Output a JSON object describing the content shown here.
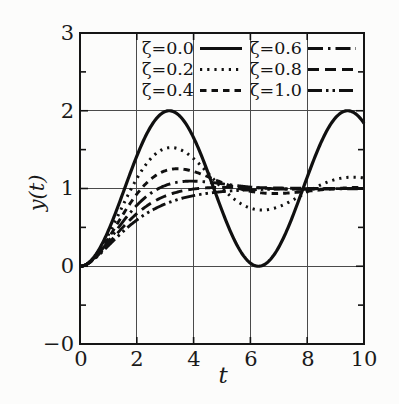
{
  "figure": {
    "background": "#fcfcfb",
    "ink": "#101010",
    "grid_color": "#4a4a4a"
  },
  "chart_data": {
    "type": "line",
    "title": "",
    "xlabel": "t",
    "ylabel": "y(t)",
    "xlim": [
      0,
      10
    ],
    "ylim": [
      -1,
      3
    ],
    "xtick_labels": [
      "0",
      "2",
      "4",
      "6",
      "8",
      "10"
    ],
    "xtick_values": [
      0,
      2,
      4,
      6,
      8,
      10
    ],
    "ytick_labels": [
      "3",
      "2",
      "1",
      "0",
      "−0"
    ],
    "ytick_values": [
      3,
      2,
      1,
      0,
      -1
    ],
    "grid": {
      "x": [
        2,
        4,
        6,
        8
      ],
      "y": [
        0,
        1,
        2
      ]
    },
    "minor_yticks": [
      -0.5,
      0.5,
      1.5,
      2.5
    ],
    "legend_position": "top-inside-two-columns",
    "model": "unit-step response of second-order system, omega_n = 1, parameter zeta",
    "x_samples": [
      0,
      1,
      2,
      3,
      4,
      5,
      6,
      7,
      8,
      9,
      10
    ],
    "series": [
      {
        "name": "ζ=0.0",
        "zeta": 0.0,
        "style": "solid",
        "dash": "",
        "width": 3.2,
        "values": [
          0,
          0.46,
          1.42,
          1.99,
          1.65,
          0.72,
          0.04,
          0.25,
          1.15,
          1.91,
          1.84
        ]
      },
      {
        "name": "ζ=0.2",
        "zeta": 0.2,
        "style": "dotted",
        "dash": "2.2 5",
        "width": 3.0,
        "values": [
          0,
          0.41,
          1.13,
          1.52,
          1.38,
          1.01,
          0.75,
          0.77,
          0.96,
          1.12,
          1.14
        ]
      },
      {
        "name": "ζ=0.4",
        "zeta": 0.4,
        "style": "short-dash",
        "dash": "6.5 5",
        "width": 2.9,
        "values": [
          0,
          0.36,
          0.93,
          1.23,
          1.22,
          1.08,
          0.96,
          0.94,
          0.96,
          1.0,
          1.02
        ]
      },
      {
        "name": "ζ=0.6",
        "zeta": 0.6,
        "style": "dash-dot",
        "dash": "15 5 2.5 5",
        "width": 2.9,
        "values": [
          0,
          0.32,
          0.78,
          1.04,
          1.09,
          1.06,
          1.02,
          0.99,
          0.99,
          1.0,
          1.0
        ]
      },
      {
        "name": "ζ=0.8",
        "zeta": 0.8,
        "style": "long-dash",
        "dash": "11 6",
        "width": 2.9,
        "values": [
          0,
          0.29,
          0.68,
          0.9,
          0.99,
          1.01,
          1.01,
          1.01,
          1.0,
          1.0,
          1.0
        ]
      },
      {
        "name": "ζ=1.0",
        "zeta": 1.0,
        "style": "dash-dot-dot",
        "dash": "14 4 2.5 4 2.5 4",
        "width": 2.9,
        "values": [
          0,
          0.26,
          0.59,
          0.8,
          0.91,
          0.96,
          0.98,
          0.99,
          1.0,
          1.0,
          1.0
        ]
      }
    ]
  }
}
